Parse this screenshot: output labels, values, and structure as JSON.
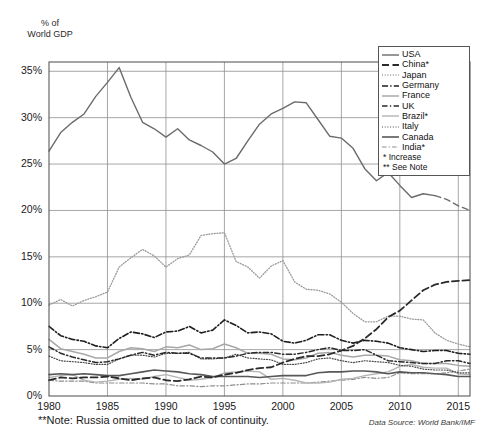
{
  "axis_title": "% of\nWorld GDP",
  "note": "**Note: Russia omitted due to lack of continuity.",
  "source": "Data Source: World Bank/IMF",
  "legend": {
    "entries": [
      {
        "label": "USA",
        "style": "solid",
        "color": "#6b6b6b",
        "width": 1.4
      },
      {
        "label": "China*",
        "style": "dash",
        "color": "#2a2a2a",
        "width": 1.8
      },
      {
        "label": "Japan",
        "style": "dot",
        "color": "#9a9a9a",
        "width": 1.3
      },
      {
        "label": "Germany",
        "style": "dashdot",
        "color": "#1e1e1e",
        "width": 1.6
      },
      {
        "label": "France",
        "style": "solid",
        "color": "#a8a8a8",
        "width": 1.5
      },
      {
        "label": "UK",
        "style": "dashdot2",
        "color": "#2a2a2a",
        "width": 1.5
      },
      {
        "label": "Brazil*",
        "style": "solid",
        "color": "#b5b5b5",
        "width": 1.4
      },
      {
        "label": "Italy",
        "style": "dot",
        "color": "#4a4a4a",
        "width": 1.2
      },
      {
        "label": "Canada",
        "style": "solid",
        "color": "#585858",
        "width": 1.6
      },
      {
        "label": "India*",
        "style": "dashdot3",
        "color": "#8d8d8d",
        "width": 1.2
      }
    ],
    "footnotes": [
      "* Increase",
      "** See Note"
    ]
  },
  "chart_data": {
    "type": "line",
    "title": "",
    "xlabel": "",
    "ylabel": "% of World GDP",
    "xlim": [
      1980,
      2016
    ],
    "ylim": [
      0,
      36
    ],
    "grid": true,
    "legend_position": "top-right",
    "xticks": [
      1980,
      1985,
      1990,
      1995,
      2000,
      2005,
      2010,
      2015
    ],
    "yticks": [
      "0%",
      "5%",
      "10%",
      "15%",
      "20%",
      "25%",
      "30%",
      "35%"
    ],
    "ytick_values": [
      0,
      5,
      10,
      15,
      20,
      25,
      30,
      35
    ],
    "x": [
      1980,
      1981,
      1982,
      1983,
      1984,
      1985,
      1986,
      1987,
      1988,
      1989,
      1990,
      1991,
      1992,
      1993,
      1994,
      1995,
      1996,
      1997,
      1998,
      1999,
      2000,
      2001,
      2002,
      2003,
      2004,
      2005,
      2006,
      2007,
      2008,
      2009,
      2010,
      2011,
      2012,
      2013,
      2014,
      2015,
      2016
    ],
    "series": [
      {
        "name": "USA",
        "values": [
          26.4,
          28.4,
          29.5,
          30.4,
          32.3,
          33.8,
          35.4,
          32.2,
          29.5,
          28.8,
          27.9,
          28.8,
          27.6,
          27.0,
          26.3,
          25.0,
          25.6,
          27.5,
          29.3,
          30.4,
          31.0,
          31.7,
          31.6,
          29.8,
          28.0,
          27.8,
          26.7,
          24.5,
          23.2,
          24.1,
          22.7,
          21.4,
          21.8,
          21.6,
          21.2,
          20.5,
          20.0
        ],
        "note": "dashed from 2013 onward (projection)"
      },
      {
        "name": "China*",
        "values": [
          1.7,
          2.0,
          1.9,
          2.0,
          2.0,
          2.1,
          1.9,
          1.7,
          1.9,
          2.0,
          1.7,
          1.6,
          1.8,
          2.1,
          2.0,
          2.3,
          2.5,
          2.8,
          3.0,
          3.1,
          3.6,
          4.0,
          4.3,
          4.3,
          4.5,
          4.9,
          5.4,
          6.2,
          7.2,
          8.5,
          9.2,
          10.3,
          11.4,
          12.0,
          12.3,
          12.4,
          12.5
        ]
      },
      {
        "name": "Japan",
        "values": [
          9.8,
          10.4,
          9.7,
          10.3,
          10.7,
          11.2,
          13.9,
          14.9,
          15.8,
          15.1,
          13.9,
          14.8,
          15.2,
          17.3,
          17.5,
          17.6,
          14.5,
          13.9,
          12.7,
          14.0,
          14.6,
          12.3,
          11.5,
          11.4,
          11.0,
          10.1,
          8.9,
          8.0,
          8.0,
          8.6,
          8.6,
          8.3,
          8.2,
          6.8,
          6.0,
          5.6,
          5.3
        ]
      },
      {
        "name": "Germany",
        "values": [
          7.5,
          6.5,
          6.1,
          5.9,
          5.4,
          5.2,
          6.2,
          6.9,
          6.7,
          6.3,
          6.9,
          7.0,
          7.5,
          6.8,
          7.1,
          8.2,
          7.6,
          6.8,
          6.9,
          6.7,
          5.9,
          5.7,
          6.0,
          6.6,
          6.6,
          6.0,
          5.7,
          6.0,
          5.9,
          5.7,
          5.2,
          5.0,
          4.8,
          4.9,
          4.9,
          4.6,
          4.5
        ]
      },
      {
        "name": "France",
        "values": [
          6.1,
          5.1,
          4.8,
          4.5,
          4.1,
          4.1,
          4.8,
          5.2,
          5.1,
          4.8,
          5.3,
          5.2,
          5.5,
          5.0,
          5.1,
          5.6,
          5.2,
          4.6,
          4.6,
          4.5,
          4.0,
          3.9,
          4.1,
          4.6,
          4.7,
          4.4,
          4.2,
          4.4,
          4.4,
          4.3,
          3.9,
          3.8,
          3.5,
          3.5,
          3.5,
          3.3,
          3.2
        ]
      },
      {
        "name": "UK",
        "values": [
          5.3,
          4.6,
          4.2,
          3.9,
          3.6,
          3.7,
          4.0,
          4.4,
          4.7,
          4.4,
          4.7,
          4.6,
          4.6,
          4.1,
          4.1,
          4.1,
          4.3,
          4.6,
          4.7,
          4.7,
          4.5,
          4.5,
          4.7,
          5.0,
          5.2,
          4.9,
          4.9,
          5.0,
          4.4,
          3.8,
          3.7,
          3.6,
          3.5,
          3.5,
          3.8,
          3.8,
          3.5
        ]
      },
      {
        "name": "Brazil*",
        "values": [
          2.0,
          2.2,
          2.3,
          1.7,
          1.5,
          1.6,
          1.8,
          1.9,
          1.8,
          2.1,
          2.3,
          2.0,
          1.7,
          1.8,
          2.0,
          2.5,
          2.6,
          2.7,
          2.6,
          1.8,
          1.9,
          1.7,
          1.4,
          1.4,
          1.5,
          1.8,
          1.9,
          2.2,
          2.4,
          2.6,
          3.2,
          3.4,
          3.1,
          3.0,
          3.0,
          2.4,
          2.3
        ]
      },
      {
        "name": "Italy",
        "values": [
          4.3,
          3.8,
          3.7,
          3.6,
          3.4,
          3.4,
          4.0,
          4.4,
          4.4,
          4.2,
          4.6,
          4.6,
          4.7,
          4.0,
          4.0,
          4.1,
          4.5,
          4.1,
          4.0,
          3.9,
          3.4,
          3.4,
          3.6,
          4.0,
          4.1,
          3.8,
          3.6,
          3.8,
          3.7,
          3.6,
          3.3,
          3.2,
          2.9,
          2.8,
          2.8,
          2.5,
          2.5
        ]
      },
      {
        "name": "Canada",
        "values": [
          2.3,
          2.4,
          2.3,
          2.4,
          2.3,
          2.2,
          2.2,
          2.4,
          2.6,
          2.8,
          2.7,
          2.6,
          2.4,
          2.3,
          2.1,
          2.1,
          2.1,
          2.1,
          2.0,
          2.1,
          2.2,
          2.2,
          2.2,
          2.5,
          2.6,
          2.6,
          2.7,
          2.7,
          2.6,
          2.4,
          2.6,
          2.5,
          2.5,
          2.4,
          2.3,
          2.1,
          2.1
        ]
      },
      {
        "name": "India*",
        "values": [
          1.7,
          1.6,
          1.6,
          1.6,
          1.4,
          1.4,
          1.4,
          1.4,
          1.4,
          1.3,
          1.3,
          1.1,
          1.1,
          1.0,
          1.1,
          1.1,
          1.2,
          1.3,
          1.3,
          1.4,
          1.4,
          1.4,
          1.4,
          1.5,
          1.6,
          1.7,
          1.8,
          2.0,
          1.9,
          2.0,
          2.5,
          2.4,
          2.4,
          2.4,
          2.5,
          2.7,
          2.9
        ]
      }
    ]
  }
}
